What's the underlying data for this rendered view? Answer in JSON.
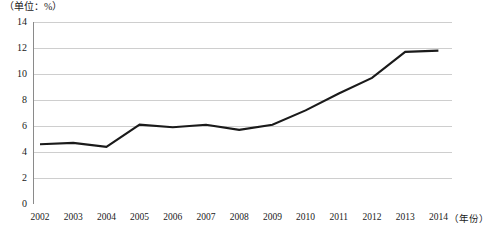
{
  "chart_data": {
    "type": "line",
    "title": "",
    "unit_label": "（单位：%）",
    "xlabel": "（年份）",
    "ylabel": "",
    "categories": [
      "2002",
      "2003",
      "2004",
      "2005",
      "2006",
      "2007",
      "2008",
      "2009",
      "2010",
      "2011",
      "2012",
      "2013",
      "2014"
    ],
    "values": [
      4.6,
      4.7,
      4.4,
      6.1,
      5.9,
      6.1,
      5.7,
      6.1,
      7.2,
      8.5,
      9.7,
      11.7,
      11.8
    ],
    "series": [
      {
        "name": "",
        "values": [
          4.6,
          4.7,
          4.4,
          6.1,
          5.9,
          6.1,
          5.7,
          6.1,
          7.2,
          8.5,
          9.7,
          11.7,
          11.8
        ]
      }
    ],
    "ylim": [
      0,
      14
    ],
    "yticks": [
      "0",
      "2",
      "4",
      "6",
      "8",
      "10",
      "12",
      "14"
    ],
    "ytick_values": [
      0,
      2,
      4,
      6,
      8,
      10,
      12,
      14
    ],
    "xlim": [
      "2002",
      "2014"
    ],
    "grid": true,
    "grid_axis": "y",
    "legend": false,
    "legend_position": "none",
    "line_color": "#1a1a1a",
    "grid_color": "#c8c8c8",
    "axis_color": "#8a8a8a",
    "background_color": "#ffffff"
  }
}
